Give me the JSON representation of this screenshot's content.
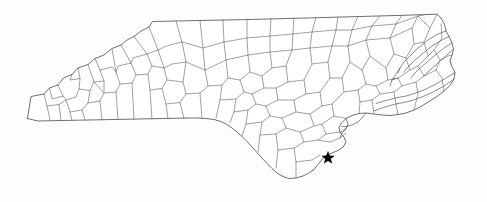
{
  "figure": {
    "kind": "map",
    "region_name": "North Carolina",
    "width": 487,
    "height": 202
  },
  "colors": {
    "background": "#fdfdfd",
    "state_outline": "#4a4a4a",
    "county_line": "#6e6e6e",
    "marker": "#000000"
  },
  "markers": [
    {
      "name": "location-star",
      "shape": "star",
      "x": 328,
      "y": 158,
      "size": 9,
      "color": "#000000"
    }
  ],
  "map_geometry": {
    "state_outline": "M 27.5 118.5 L 31 96.5 L 44 94.0 L 49.5 88.0 L 58 85.0 L 63.5 78.0 L 72 74.5 L 78 68.0 L 88 64.5 L 95 58.5 L 104 55.0 L 112 48.5 L 121 45.0 L 127 40.0 L 134 36.5 L 141 31.0 L 149 27.0 L 152.5 21.5 L 200 20.5 L 250 19.5 L 300 18.2 L 350 16.8 L 400 15.4 L 437 14.2 L 441 18.0 L 444.5 24.5 L 446 31.0 L 449 36.5 L 452 43.0 L 453.5 49.0 L 452 55.0 L 450 61.0 L 452 67.0 L 455 72.5 L 454 79.0 L 450 85.5 L 444 91.0 L 437 96.5 L 429 101.5 L 421 106.5 L 414 110.0 L 406 113.0 L 398 114.5 L 390 115.5 L 382 115.0 L 374 114.0 L 366 113.0 L 359 113.5 L 352 115.5 L 346 118.5 L 342 122.5 L 339 127.0 L 340 132.5 L 344 137.0 L 346 142.0 L 343 147.0 L 338 150.5 L 332 153.0 L 326 155.5 L 322 159.5 L 318 164.5 L 314 169.5 L 309 173.0 L 303 176.0 L 296 178.0 L 289 178.5 L 283 176.5 L 277 173.0 L 272 168.5 L 267 163.5 L 262 158.0 L 257 152.5 L 252 147.0 L 247 141.5 L 242 136.5 L 237 132.0 L 232 128.0 L 227 124.5 L 221 121.5 L 214 119.5 L 206 118.5 L 197 118.0 L 188 118.0 L 178 118.2 L 168 118.4 L 158 118.6 L 148 118.8 L 138 119.0 L 128 119.2 L 118 119.4 L 108 119.6 L 98 119.8 L 88 120.0 L 78 120.2 L 68 120.4 L 58 120.6 L 48 120.8 L 38 121.0 L 27.5 118.5 Z",
    "county_lines": [
      "M 44 94.0 L 47 106.0 L 50 119.9",
      "M 47 106.0 L 59 104.5 L 66 100.0",
      "M 59 104.5 L 61 120.5",
      "M 58 85.0 L 63 96.0 L 66 100.0 L 76 97.0 L 79 89.0",
      "M 63 96.0 L 52 99.0 L 49.5 88.0",
      "M 78 68.0 L 80 78.5 L 79 89.0 L 90 90.5 L 94 82.0 L 88 64.5",
      "M 80 78.5 L 70 80.0 L 72 74.5",
      "M 66 100.0 L 70 112.0 L 72 120.3",
      "M 70 112.0 L 82 110.0 L 88 103.0 L 90 90.5",
      "M 82 110.0 L 85 120.1",
      "M 88 103.0 L 100 101.0 L 104 93.0 L 94 82.0",
      "M 100 101.0 L 102 119.8",
      "M 95 58.5 L 100 70.0 L 104 81.0 L 104 93.0 L 116 92.0 L 120 84.0 L 116 72.0 L 112 48.5",
      "M 104 81.0 L 94 82.0",
      "M 100 70.0 L 112 67.0 L 116 72.0",
      "M 116 92.0 L 118 119.5",
      "M 120 84.0 L 132 83.0 L 136 75.0 L 131 63.0 L 121 45.0",
      "M 131 63.0 L 118 66.0 L 116 72.0",
      "M 132 83.0 L 134 119.3",
      "M 136 75.0 L 148 74.0 L 152 66.0 L 147 54.0 L 134 36.5",
      "M 147 54.0 L 133 58.0 L 131 63.0",
      "M 148 74.0 L 150 90.0 L 152 119.1",
      "M 150 90.0 L 162 88.5 L 167 80.0 L 164 68.0 L 152 66.0",
      "M 164 68.0 L 158 50.0 L 149 27.0",
      "M 158 50.0 L 147 54.0",
      "M 162 88.5 L 166 104.0 L 168 118.9",
      "M 166 104.0 L 180 102.5 L 186 94.0 L 183 82.0 L 167 80.0",
      "M 183 82.0 L 186 62.0 L 182 42.0 L 176 21.0",
      "M 182 42.0 L 166 46.0 L 158 50.0",
      "M 186 62.0 L 172 64.0 L 164 68.0",
      "M 180 102.5 L 184 118.6",
      "M 186 94.0 L 200 93.0 L 208 86.0 L 205 70.0 L 186 62.0",
      "M 205 70.0 L 203 48.0 L 200 20.5",
      "M 203 48.0 L 182 42.0",
      "M 200 93.0 L 202 118.4",
      "M 208 86.0 L 222 85.0 L 228 78.0 L 226 60.0 L 205 70.0",
      "M 226 60.0 L 224 42.0 L 223 19.8",
      "M 224 42.0 L 203 48.0",
      "M 222 85.0 L 220 100.0 L 216 118.2",
      "M 220 100.0 L 236 99.0 L 244 92.0 L 240 80.0 L 228 78.0",
      "M 240 80.0 L 250 72.0 L 248 55.0 L 226 60.0",
      "M 248 55.0 L 247 38.0 L 247 19.0",
      "M 247 38.0 L 224 42.0",
      "M 236 99.0 L 234 112.0 L 230 122.5",
      "M 234 112.0 L 248 110.0 L 256 104.0 L 252 94.0 L 244 92.0",
      "M 252 94.0 L 264 88.0 L 262 76.0 L 250 72.0",
      "M 262 76.0 L 272 68.0 L 270 52.0 L 248 55.0",
      "M 270 52.0 L 270 36.0 L 271 18.4",
      "M 270 36.0 L 247 38.0",
      "M 248 110.0 L 246 124.0 L 242 136.0",
      "M 246 124.0 L 262 122.0 L 270 116.0 L 266 106.0 L 256 104.0",
      "M 266 106.0 L 278 100.0 L 276 88.0 L 264 88.0",
      "M 276 88.0 L 288 82.0 L 286 66.0 L 272 68.0",
      "M 286 66.0 L 292 50.0 L 293 34.0 L 294 17.9",
      "M 293 34.0 L 270 36.0",
      "M 292 50.0 L 270 52.0",
      "M 262 122.0 L 260 135.0 L 258 152.0",
      "M 260 135.0 L 276 134.0 L 286 128.0 L 282 118.0 L 270 116.0",
      "M 282 118.0 L 296 112.0 L 294 100.0 L 278 100.0",
      "M 294 100.0 L 306 94.0 L 304 80.0 L 288 82.0",
      "M 304 80.0 L 312 64.0 L 310 48.0 L 292 50.0",
      "M 310 48.0 L 312 32.0 L 316 17.4",
      "M 312 32.0 L 293 34.0",
      "M 276 134.0 L 278 150.0 L 276 168.0",
      "M 278 150.0 L 294 148.0 L 304 142.0 L 300 132.0 L 286 128.0",
      "M 300 132.0 L 314 126.0 L 310 114.0 L 296 112.0",
      "M 310 114.0 L 322 106.0 L 320 92.0 L 306 94.0",
      "M 320 92.0 L 330 78.0 L 328 62.0 L 312 64.0",
      "M 328 62.0 L 332 46.0 L 336 30.0 L 338 16.9",
      "M 336 30.0 L 312 32.0",
      "M 332 46.0 L 310 48.0",
      "M 294 148.0 L 296 162.0 L 296 178.0",
      "M 296 162.0 L 312 160.0 L 320 155.0",
      "M 304 142.0 L 318 140.0 L 326 134.0 L 322 124.0 L 314 126.0",
      "M 322 124.0 L 334 116.0 L 332 104.0 L 322 106.0",
      "M 332 104.0 L 344 92.0 L 342 78.0 L 330 78.0",
      "M 342 78.0 L 350 62.0 L 348 46.0 L 332 46.0",
      "M 348 46.0 L 352 30.0 L 358 16.4",
      "M 352 30.0 L 336 30.0",
      "M 318 140.0 L 330 142.0 L 340 138.0 L 346 133.0",
      "M 326 134.0 L 340 132.0",
      "M 334 116.0 L 346 118.5",
      "M 344 92.0 L 358 90.0 L 366 84.0 L 362 70.0 L 350 62.0",
      "M 362 70.0 L 370 56.0 L 366 40.0 L 348 46.0",
      "M 366 40.0 L 372 26.0 L 380 15.9",
      "M 372 26.0 L 352 30.0",
      "M 358 90.0 L 360 102.0 L 359 113.5",
      "M 360 102.0 L 372 100.0 L 380 94.0 L 376 86.0 L 366 84.0",
      "M 376 86.0 L 388 80.0 L 386 68.0 L 370 56.0",
      "M 386 68.0 L 394 54.0 L 390 38.0 L 366 40.0",
      "M 390 38.0 L 396 24.0 L 402 15.4",
      "M 396 24.0 L 372 26.0",
      "M 372 100.0 L 374 114.0",
      "M 380 94.0 L 394 92.0 L 402 86.0 L 398 78.0 L 388 80.0",
      "M 398 78.0 L 410 70.0 L 406 58.0 L 394 54.0",
      "M 406 58.0 L 414 44.0 L 412 28.0 L 390 38.0",
      "M 412 28.0 L 418 16.0 L 424 14.9",
      "M 418 16.0 L 396 24.0",
      "M 394 92.0 L 396 104.0 L 398 114.5",
      "M 402 86.0 L 416 82.0 L 424 76.0 L 418 66.0 L 410 70.0",
      "M 418 66.0 L 428 56.0 L 424 42.0 L 414 44.0",
      "M 424 42.0 L 430 28.0 L 437 14.2",
      "M 430 28.0 L 418 16.0",
      "M 416 82.0 L 418 94.0 L 414 110.0",
      "M 424 76.0 L 436 70.0 L 440 60.0 L 434 50.0 L 428 56.0",
      "M 434 50.0 L 442 38.0 L 441 24.0",
      "M 440 60.0 L 448 56.0 L 452 55.0",
      "M 436 70.0 L 442 78.0 L 444 91.0"
    ],
    "barrier_islands": [
      "M 446 31.0 L 438 34.0 L 428 40.0 L 418 48.0 L 410 56.0 L 404 62.0 L 400 68.0 L 398 73.0",
      "M 449 36.5 L 442 40.0 L 432 46.0 L 422 54.0 L 414 61.0 L 408 67.0 L 404 72.0",
      "M 452 43.0 L 444 48.0 L 434 56.0 L 426 63.0 L 419 69.0 L 414 74.0 L 411 78.0",
      "M 453.5 49.0 L 447 55.0 L 438 63.0 L 430 70.0 L 424 76.0",
      "M 455 72.5 L 446 78.0 L 436 84.0 L 426 89.0 L 416 93.0 L 406 96.0 L 398 97.5",
      "M 454 79.0 L 444 86.0 L 433 92.0 L 422 97.0 L 412 100.5 L 404 102.5 L 398 103.5",
      "M 398 97.5 L 392 99.0 L 384 101.0 L 376 103.5",
      "M 398 103.5 L 390 105.5 L 382 108.0 L 374 111.0",
      "M 400 68.0 L 396 74.0 L 392 80.0 L 390 86.0",
      "M 392 80.0 L 398 78.0",
      "M 366 113.0 L 362 118.0 L 358 122.0 L 352 125.0 L 346 126.5 L 342 126.5",
      "M 346 118.5 L 348 124.0 L 346 129.0 L 342 133.0 L 340 138.0",
      "M 340 132.5 L 344 130.0 L 348 126.0"
    ]
  }
}
